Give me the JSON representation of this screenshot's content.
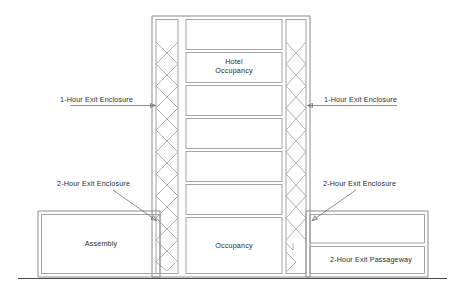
{
  "diagram": {
    "labels": {
      "hotel_occupancy": "Hotel\nOccupancy",
      "hotel_occupancy_line1": "Hotel",
      "hotel_occupancy_line2": "Occupancy",
      "occupancy": "Occupancy",
      "assembly": "Assembly",
      "exit_passageway": "2-Hour Exit Passageway",
      "one_hour_left": "1-Hour Exit Enclosure",
      "one_hour_right": "1-Hour Exit Enclosure",
      "two_hour_left": "2-Hour Exit Enclosure",
      "two_hour_right": "2-Hour Exit Enclosure"
    },
    "colors": {
      "background": "#ffffff",
      "wall_stroke": "#8a8a8a",
      "room_stroke": "#9c9c9c",
      "stair_stroke": "#8f8f8f",
      "leader_stroke": "#5e5e5e",
      "ground_stroke": "#4a4a4a",
      "text": "#2b2b2b"
    },
    "structure": {
      "tower_floors": 7,
      "stair_shafts": 2,
      "wings": 2,
      "right_wing_boxes": 2
    }
  }
}
